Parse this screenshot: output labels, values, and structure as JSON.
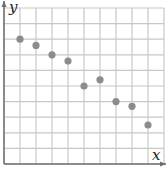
{
  "chart_data": {
    "type": "scatter",
    "title": "",
    "xlabel": "x",
    "ylabel": "y",
    "xlim": [
      0,
      10
    ],
    "ylim": [
      0,
      10
    ],
    "grid": true,
    "grid_cells": [
      10,
      10
    ],
    "tick_labels": false,
    "points": [
      {
        "x": 1,
        "y": 8.0
      },
      {
        "x": 2,
        "y": 7.6
      },
      {
        "x": 3,
        "y": 7.0
      },
      {
        "x": 4,
        "y": 6.6
      },
      {
        "x": 5,
        "y": 5.0
      },
      {
        "x": 6,
        "y": 5.4
      },
      {
        "x": 7,
        "y": 4.0
      },
      {
        "x": 8,
        "y": 3.7
      },
      {
        "x": 9,
        "y": 2.5
      }
    ],
    "colors": {
      "point": "#8c8c8c",
      "grid": "#c8c8c8",
      "axis": "#6e6e6e"
    }
  }
}
